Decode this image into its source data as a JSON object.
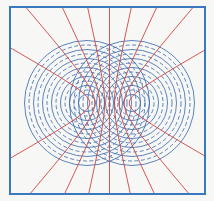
{
  "figure": {
    "title": "",
    "frame": {
      "x": 10,
      "y": 7,
      "w": 195,
      "h": 187,
      "color": "#3a78c0"
    },
    "sources": [
      {
        "cx": 87,
        "cy": 103
      },
      {
        "cx": 132,
        "cy": 103
      }
    ],
    "wavelength": 9,
    "ring_count": 13,
    "crest_style": "solid",
    "trough_style": "dashed",
    "colors": {
      "wavefront": "#3f6fb0",
      "interference_lines": "#d0453f",
      "background": "#f7f8f6"
    },
    "interference_line_count": 9
  }
}
